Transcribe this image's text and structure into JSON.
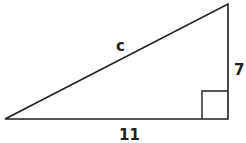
{
  "diagram": {
    "type": "right-triangle",
    "labels": {
      "hypotenuse": "c",
      "vertical_leg": "7",
      "horizontal_leg": "11"
    },
    "right_angle_marker": true,
    "stroke_color": "#231f20"
  }
}
